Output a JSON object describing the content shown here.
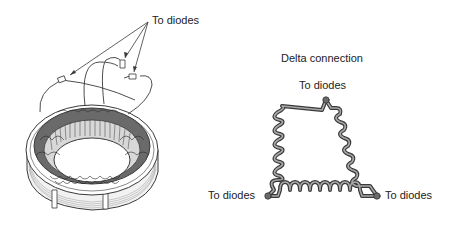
{
  "stator": {
    "label": "To diodes"
  },
  "delta": {
    "title": "Delta connection",
    "top_label": "To diodes",
    "left_label": "To diodes",
    "right_label": "To diodes"
  },
  "colors": {
    "line": "#3a3a3a",
    "coil": "#8a8a8a",
    "fill_light": "#e6e6e6",
    "fill_dark": "#5a5a5a",
    "text": "#222222"
  }
}
